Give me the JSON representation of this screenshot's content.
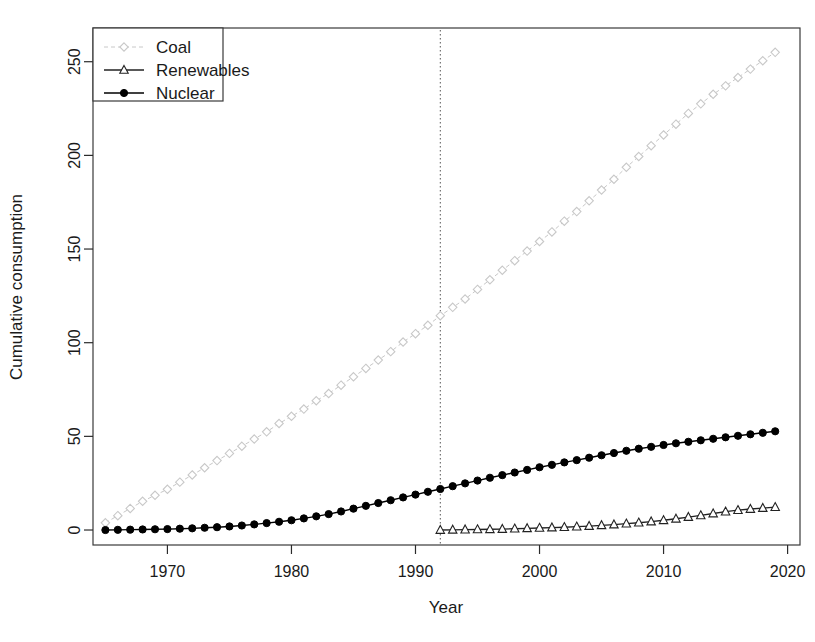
{
  "chart_data": {
    "type": "line",
    "title": "",
    "xlabel": "Year",
    "ylabel": "Cumulative consumption",
    "xlim": [
      1964,
      2021
    ],
    "ylim": [
      -8,
      268
    ],
    "xticks": [
      1970,
      1980,
      1990,
      2000,
      2010,
      2020
    ],
    "yticks": [
      0,
      50,
      100,
      150,
      200,
      250
    ],
    "grid": false,
    "legend_position": "top-left",
    "annotations": [
      {
        "name": "vertical-reference-line",
        "type": "vline",
        "x": 1992,
        "style": "dotted"
      }
    ],
    "series": [
      {
        "name": "Coal",
        "color": "#c8c8c8",
        "marker": "open-diamond",
        "linestyle": "dashed",
        "x": [
          1965,
          1966,
          1967,
          1968,
          1969,
          1970,
          1971,
          1972,
          1973,
          1974,
          1975,
          1976,
          1977,
          1978,
          1979,
          1980,
          1981,
          1982,
          1983,
          1984,
          1985,
          1986,
          1987,
          1988,
          1989,
          1990,
          1991,
          1992,
          1993,
          1994,
          1995,
          1996,
          1997,
          1998,
          1999,
          2000,
          2001,
          2002,
          2003,
          2004,
          2005,
          2006,
          2007,
          2008,
          2009,
          2010,
          2011,
          2012,
          2013,
          2014,
          2015,
          2016,
          2017,
          2018,
          2019
        ],
        "values": [
          6,
          12,
          18,
          24,
          29,
          34,
          40,
          46,
          52,
          58,
          64,
          70,
          76,
          82,
          89,
          95,
          101,
          108,
          114,
          121,
          128,
          135,
          142,
          149,
          157,
          164,
          171,
          179,
          186,
          193,
          201,
          209,
          217,
          225,
          233,
          241,
          249,
          258,
          266,
          275,
          284,
          293,
          303,
          312,
          321,
          330,
          339,
          348,
          356,
          364,
          371,
          378,
          385,
          392,
          399
        ]
      },
      {
        "name": "Renewables",
        "color": "#222222",
        "marker": "open-triangle",
        "linestyle": "solid",
        "x": [
          1992,
          1993,
          1994,
          1995,
          1996,
          1997,
          1998,
          1999,
          2000,
          2001,
          2002,
          2003,
          2004,
          2005,
          2006,
          2007,
          2008,
          2009,
          2010,
          2011,
          2012,
          2013,
          2014,
          2015,
          2016,
          2017,
          2018,
          2019
        ],
        "values": [
          0.0,
          0.1,
          0.2,
          0.3,
          0.4,
          0.5,
          0.7,
          0.9,
          1.1,
          1.3,
          1.5,
          1.8,
          2.1,
          2.5,
          2.9,
          3.4,
          3.9,
          4.5,
          5.2,
          6.0,
          6.9,
          7.8,
          8.8,
          9.8,
          10.6,
          11.2,
          11.7,
          12.2
        ]
      },
      {
        "name": "Nuclear",
        "color": "#000000",
        "marker": "filled-circle",
        "linestyle": "solid",
        "x": [
          1965,
          1966,
          1967,
          1968,
          1969,
          1970,
          1971,
          1972,
          1973,
          1974,
          1975,
          1976,
          1977,
          1978,
          1979,
          1980,
          1981,
          1982,
          1983,
          1984,
          1985,
          1986,
          1987,
          1988,
          1989,
          1990,
          1991,
          1992,
          1993,
          1994,
          1995,
          1996,
          1997,
          1998,
          1999,
          2000,
          2001,
          2002,
          2003,
          2004,
          2005,
          2006,
          2007,
          2008,
          2009,
          2010,
          2011,
          2012,
          2013,
          2014,
          2015,
          2016,
          2017,
          2018,
          2019
        ],
        "values": [
          0.0,
          0.1,
          0.2,
          0.3,
          0.4,
          0.5,
          0.7,
          0.9,
          1.2,
          1.5,
          1.9,
          2.4,
          3.0,
          3.7,
          4.4,
          5.2,
          6.2,
          7.3,
          8.5,
          9.9,
          11.4,
          12.9,
          14.4,
          15.9,
          17.4,
          18.9,
          20.4,
          21.9,
          23.4,
          24.9,
          26.4,
          27.9,
          29.3,
          30.7,
          32.1,
          33.5,
          34.8,
          36.1,
          37.3,
          38.6,
          39.9,
          41.1,
          42.3,
          43.4,
          44.4,
          45.4,
          46.3,
          47.1,
          47.9,
          48.7,
          49.5,
          50.3,
          51.1,
          51.9,
          52.7
        ]
      }
    ]
  },
  "legend": {
    "entries": [
      {
        "label": "Coal"
      },
      {
        "label": "Renewables"
      },
      {
        "label": "Nuclear"
      }
    ]
  },
  "axes": {
    "x_title": "Year",
    "y_title": "Cumulative consumption",
    "x_tick_labels": [
      "1970",
      "1980",
      "1990",
      "2000",
      "2010",
      "2020"
    ],
    "y_tick_labels": [
      "0",
      "50",
      "100",
      "150",
      "200",
      "250"
    ]
  },
  "colors": {
    "coal": "#c8c8c8",
    "renewables": "#222222",
    "nuclear": "#000000",
    "frame": "#3a3a3a",
    "text": "#1a1a1a"
  }
}
